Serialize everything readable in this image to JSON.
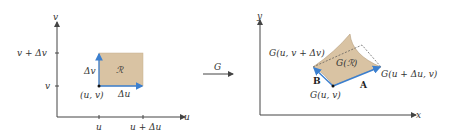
{
  "colors": {
    "axis": "#444444",
    "region_fill": "#d9c3a3",
    "region_stroke": "#b59e7e",
    "vector": "#3b7fcf",
    "dashed": "#555555"
  },
  "left_panel": {
    "vertical_axis_label": "v",
    "horizontal_axis_label": "u",
    "y_ticks": [
      "v + Δv",
      "v"
    ],
    "x_ticks": [
      "u",
      "u + Δu"
    ],
    "region_label": "ℛ",
    "corner_label": "(u, v)",
    "du_label": "Δu",
    "dv_label": "Δv"
  },
  "map_arrow": {
    "label": "G"
  },
  "right_panel": {
    "vertical_axis_label": "y",
    "horizontal_axis_label": "x",
    "region_label": "G(ℛ)",
    "top_left_label": "G(u, v + Δv)",
    "right_label": "G(u + Δu, v)",
    "bottom_label": "G(u, v)",
    "vector_a_label": "A",
    "vector_b_label": "B"
  }
}
